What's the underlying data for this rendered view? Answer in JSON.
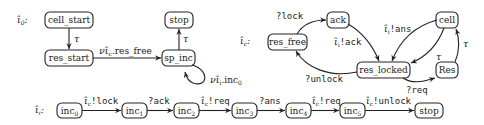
{
  "automata": [
    {
      "name": "iota_0",
      "label": "ι̂",
      "label_sub": "0",
      "nodes": [
        {
          "id": "cell_start",
          "text": "cell_start"
        },
        {
          "id": "res_start",
          "text": "res_start"
        },
        {
          "id": "sp_inc",
          "text": "sp_inc"
        },
        {
          "id": "stop",
          "text": "stop"
        }
      ],
      "edges": [
        {
          "from": "cell_start",
          "to": "res_start",
          "label": "τ"
        },
        {
          "from": "res_start",
          "to": "sp_inc",
          "label_prefix": "ν",
          "label_hat": "ι̂",
          "label_hat_sub": "c",
          "label": ".res_free"
        },
        {
          "from": "sp_inc",
          "to": "stop",
          "label": "τ"
        },
        {
          "from": "sp_inc",
          "to": "sp_inc",
          "label_prefix": "ν",
          "label_hat": "ι̂",
          "label_hat_sub": "i",
          "label": ".inc",
          "label_sub": "0"
        }
      ]
    },
    {
      "name": "iota_c",
      "label": "ι̂",
      "label_sub": "c",
      "nodes": [
        {
          "id": "res_free",
          "text": "res_free"
        },
        {
          "id": "ack",
          "text": "ack"
        },
        {
          "id": "res_locked",
          "text": "res_locked"
        },
        {
          "id": "cell",
          "text": "cell"
        },
        {
          "id": "Res",
          "text": "Res"
        }
      ],
      "edges": [
        {
          "from": "res_free",
          "to": "ack",
          "label": "?lock"
        },
        {
          "from": "ack",
          "to": "res_locked",
          "label_hat": "ι̂",
          "label_hat_sub": "i",
          "label": "!ack"
        },
        {
          "from": "res_locked",
          "to": "res_free",
          "label": "?unlock"
        },
        {
          "from": "cell",
          "to": "res_locked",
          "label_hat": "ι̂",
          "label_hat_sub": "i",
          "label": "!ans"
        },
        {
          "from": "cell",
          "to": "res_locked",
          "label": "τ"
        },
        {
          "from": "res_locked",
          "to": "Res",
          "label": "?req"
        },
        {
          "from": "Res",
          "to": "cell",
          "label": "τ"
        }
      ]
    },
    {
      "name": "iota_i",
      "label": "ι̂",
      "label_sub": "i",
      "nodes": [
        {
          "id": "inc0",
          "text": "inc",
          "sub": "0"
        },
        {
          "id": "inc1",
          "text": "inc",
          "sub": "1"
        },
        {
          "id": "inc2",
          "text": "inc",
          "sub": "2"
        },
        {
          "id": "inc3",
          "text": "inc",
          "sub": "3"
        },
        {
          "id": "inc4",
          "text": "inc",
          "sub": "4"
        },
        {
          "id": "inc5",
          "text": "inc",
          "sub": "5"
        },
        {
          "id": "stop",
          "text": "stop"
        }
      ],
      "edges": [
        {
          "from": "inc0",
          "to": "inc1",
          "label_hat": "ι̂",
          "label_hat_sub": "c",
          "label": "!lock"
        },
        {
          "from": "inc1",
          "to": "inc2",
          "label": "?ack"
        },
        {
          "from": "inc2",
          "to": "inc3",
          "label_hat": "ι̂",
          "label_hat_sub": "c",
          "label": "!req"
        },
        {
          "from": "inc3",
          "to": "inc4",
          "label": "?ans"
        },
        {
          "from": "inc4",
          "to": "inc5",
          "label_hat": "ι̂",
          "label_hat_sub": "c",
          "label": "!req"
        },
        {
          "from": "inc5",
          "to": "stop",
          "label_hat": "ι̂",
          "label_hat_sub": "c",
          "label": "!unlock"
        }
      ]
    }
  ],
  "colors": {
    "stroke": "#222222",
    "background": "#ffffff"
  }
}
